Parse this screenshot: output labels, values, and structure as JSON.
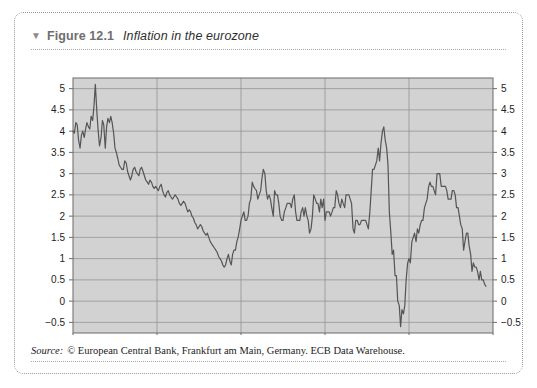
{
  "figure": {
    "triangle_glyph": "▼",
    "number": "Figure 12.1",
    "title": "Inflation in the eurozone"
  },
  "footer": {
    "source_label": "Source:",
    "source_text": "© European Central Bank, Frankfurt am Main, Germany. ECB Data Warehouse."
  },
  "colors": {
    "plot_background": "#d2d2d2",
    "gridline": "#8c8c8c",
    "line": "#555555",
    "axis": "#6b6b6b",
    "tick_label": "#1c1c1c",
    "card_border": "#9a9a9a",
    "page_background": "#ffffff"
  },
  "chart_data": {
    "type": "line",
    "title": "Inflation in the eurozone",
    "xlabel": "",
    "ylabel": "",
    "xlim": [
      1990,
      2015
    ],
    "ylim": [
      -0.75,
      5.25
    ],
    "grid": true,
    "legend_position": "none",
    "x_ticks": [
      1990,
      1995,
      2000,
      2005,
      2010,
      2015
    ],
    "x_tick_labels": [
      "1990",
      "1995",
      "2000",
      "2005",
      "2010",
      "2015"
    ],
    "y_ticks": [
      -0.5,
      0,
      0.5,
      1,
      1.5,
      2,
      2.5,
      3,
      3.5,
      4,
      4.5,
      5
    ],
    "y_tick_labels": [
      "−0.5",
      "0",
      "0.5",
      "1",
      "1.5",
      "2",
      "2.5",
      "3",
      "3.5",
      "4",
      "4.5",
      "5"
    ],
    "y_axis_both_sides": true,
    "series": [
      {
        "name": "Eurozone inflation rate (annual %, monthly)",
        "x": [
          1990.0,
          1990.08,
          1990.17,
          1990.25,
          1990.33,
          1990.42,
          1990.5,
          1990.58,
          1990.67,
          1990.75,
          1990.83,
          1990.92,
          1991.0,
          1991.08,
          1991.17,
          1991.25,
          1991.33,
          1991.42,
          1991.5,
          1991.58,
          1991.67,
          1991.75,
          1991.83,
          1991.92,
          1992.0,
          1992.08,
          1992.17,
          1992.25,
          1992.33,
          1992.42,
          1992.5,
          1992.58,
          1992.67,
          1992.75,
          1992.83,
          1992.92,
          1993.0,
          1993.08,
          1993.17,
          1993.25,
          1993.33,
          1993.42,
          1993.5,
          1993.58,
          1993.67,
          1993.75,
          1993.83,
          1993.92,
          1994.0,
          1994.08,
          1994.17,
          1994.25,
          1994.33,
          1994.42,
          1994.5,
          1994.58,
          1994.67,
          1994.75,
          1994.83,
          1994.92,
          1995.0,
          1995.08,
          1995.17,
          1995.25,
          1995.33,
          1995.42,
          1995.5,
          1995.58,
          1995.67,
          1995.75,
          1995.83,
          1995.92,
          1996.0,
          1996.08,
          1996.17,
          1996.25,
          1996.33,
          1996.42,
          1996.5,
          1996.58,
          1996.67,
          1996.75,
          1996.83,
          1996.92,
          1997.0,
          1997.08,
          1997.17,
          1997.25,
          1997.33,
          1997.42,
          1997.5,
          1997.58,
          1997.67,
          1997.75,
          1997.83,
          1997.92,
          1998.0,
          1998.08,
          1998.17,
          1998.25,
          1998.33,
          1998.42,
          1998.5,
          1998.58,
          1998.67,
          1998.75,
          1998.83,
          1998.92,
          1999.0,
          1999.08,
          1999.17,
          1999.25,
          1999.33,
          1999.42,
          1999.5,
          1999.58,
          1999.67,
          1999.75,
          1999.83,
          1999.92,
          2000.0,
          2000.08,
          2000.17,
          2000.25,
          2000.33,
          2000.42,
          2000.5,
          2000.58,
          2000.67,
          2000.75,
          2000.83,
          2000.92,
          2001.0,
          2001.08,
          2001.17,
          2001.25,
          2001.33,
          2001.42,
          2001.5,
          2001.58,
          2001.67,
          2001.75,
          2001.83,
          2001.92,
          2002.0,
          2002.08,
          2002.17,
          2002.25,
          2002.33,
          2002.42,
          2002.5,
          2002.58,
          2002.67,
          2002.75,
          2002.83,
          2002.92,
          2003.0,
          2003.08,
          2003.17,
          2003.25,
          2003.33,
          2003.42,
          2003.5,
          2003.58,
          2003.67,
          2003.75,
          2003.83,
          2003.92,
          2004.0,
          2004.08,
          2004.17,
          2004.25,
          2004.33,
          2004.42,
          2004.5,
          2004.58,
          2004.67,
          2004.75,
          2004.83,
          2004.92,
          2005.0,
          2005.08,
          2005.17,
          2005.25,
          2005.33,
          2005.42,
          2005.5,
          2005.58,
          2005.67,
          2005.75,
          2005.83,
          2005.92,
          2006.0,
          2006.08,
          2006.17,
          2006.25,
          2006.33,
          2006.42,
          2006.5,
          2006.58,
          2006.67,
          2006.75,
          2006.83,
          2006.92,
          2007.0,
          2007.08,
          2007.17,
          2007.25,
          2007.33,
          2007.42,
          2007.5,
          2007.58,
          2007.67,
          2007.75,
          2007.83,
          2007.92,
          2008.0,
          2008.08,
          2008.17,
          2008.25,
          2008.33,
          2008.42,
          2008.5,
          2008.58,
          2008.67,
          2008.75,
          2008.83,
          2008.92,
          2009.0,
          2009.08,
          2009.17,
          2009.25,
          2009.33,
          2009.42,
          2009.5,
          2009.58,
          2009.67,
          2009.75,
          2009.83,
          2009.92,
          2010.0,
          2010.08,
          2010.17,
          2010.25,
          2010.33,
          2010.42,
          2010.5,
          2010.58,
          2010.67,
          2010.75,
          2010.83,
          2010.92,
          2011.0,
          2011.08,
          2011.17,
          2011.25,
          2011.33,
          2011.42,
          2011.5,
          2011.58,
          2011.67,
          2011.75,
          2011.83,
          2011.92,
          2012.0,
          2012.08,
          2012.17,
          2012.25,
          2012.33,
          2012.42,
          2012.5,
          2012.58,
          2012.67,
          2012.75,
          2012.83,
          2012.92,
          2013.0,
          2013.08,
          2013.17,
          2013.25,
          2013.33,
          2013.42,
          2013.5,
          2013.58,
          2013.67,
          2013.75,
          2013.83,
          2013.92,
          2014.0,
          2014.08,
          2014.17,
          2014.25,
          2014.33,
          2014.42,
          2014.5,
          2014.58
        ],
        "values": [
          4.0,
          3.95,
          4.2,
          4.15,
          3.8,
          3.6,
          3.9,
          4.0,
          3.85,
          4.05,
          4.2,
          4.1,
          4.05,
          4.35,
          4.25,
          4.6,
          5.1,
          4.45,
          4.0,
          3.65,
          3.85,
          4.25,
          4.15,
          3.6,
          4.1,
          4.3,
          4.2,
          4.35,
          4.2,
          3.95,
          3.6,
          3.5,
          3.35,
          3.2,
          3.15,
          3.1,
          3.1,
          3.3,
          3.25,
          3.05,
          2.95,
          2.85,
          2.95,
          3.1,
          3.15,
          3.05,
          3.0,
          2.95,
          3.1,
          3.15,
          3.05,
          2.95,
          2.85,
          2.8,
          2.75,
          2.85,
          2.8,
          2.7,
          2.65,
          2.7,
          2.65,
          2.6,
          2.7,
          2.75,
          2.6,
          2.5,
          2.45,
          2.55,
          2.6,
          2.5,
          2.45,
          2.4,
          2.45,
          2.5,
          2.45,
          2.4,
          2.3,
          2.25,
          2.3,
          2.35,
          2.3,
          2.2,
          2.1,
          2.15,
          2.1,
          2.0,
          1.95,
          1.85,
          1.8,
          1.7,
          1.75,
          1.8,
          1.75,
          1.65,
          1.6,
          1.55,
          1.6,
          1.5,
          1.4,
          1.35,
          1.3,
          1.25,
          1.2,
          1.15,
          1.05,
          1.0,
          0.95,
          0.85,
          0.8,
          0.85,
          1.0,
          1.1,
          0.95,
          0.85,
          1.1,
          1.2,
          1.2,
          1.4,
          1.5,
          1.7,
          1.9,
          2.0,
          2.1,
          1.9,
          1.9,
          2.0,
          2.3,
          2.4,
          2.8,
          2.7,
          2.65,
          2.6,
          2.4,
          2.5,
          2.6,
          2.9,
          3.1,
          3.0,
          2.6,
          2.4,
          2.5,
          2.4,
          2.2,
          2.0,
          2.6,
          2.5,
          2.5,
          2.3,
          2.0,
          1.9,
          1.9,
          2.1,
          2.2,
          2.3,
          2.3,
          2.3,
          2.2,
          2.4,
          2.5,
          2.1,
          1.9,
          1.9,
          1.9,
          2.1,
          2.2,
          2.0,
          2.2,
          2.0,
          1.9,
          1.6,
          1.7,
          2.0,
          2.5,
          2.4,
          2.3,
          2.3,
          2.1,
          2.4,
          2.2,
          2.4,
          1.9,
          2.1,
          2.1,
          2.1,
          2.0,
          2.1,
          2.2,
          2.2,
          2.6,
          2.5,
          2.3,
          2.2,
          2.4,
          2.3,
          2.2,
          2.5,
          2.5,
          2.5,
          2.4,
          2.3,
          1.7,
          1.6,
          1.9,
          1.9,
          1.8,
          1.8,
          1.9,
          1.9,
          1.9,
          1.9,
          1.8,
          1.7,
          2.1,
          2.6,
          3.1,
          3.1,
          3.2,
          3.3,
          3.6,
          3.3,
          3.7,
          4.0,
          4.1,
          3.8,
          3.6,
          3.2,
          2.1,
          1.6,
          1.1,
          1.2,
          0.6,
          0.6,
          0.0,
          -0.1,
          -0.6,
          -0.2,
          -0.3,
          -0.1,
          0.5,
          0.9,
          1.0,
          0.9,
          1.4,
          1.5,
          1.6,
          1.4,
          1.7,
          1.6,
          1.8,
          1.9,
          1.9,
          2.2,
          2.3,
          2.4,
          2.7,
          2.8,
          2.7,
          2.7,
          2.6,
          2.5,
          3.0,
          3.0,
          3.0,
          2.7,
          2.7,
          2.7,
          2.7,
          2.6,
          2.4,
          2.4,
          2.4,
          2.6,
          2.6,
          2.5,
          2.2,
          2.2,
          2.0,
          1.8,
          1.7,
          1.2,
          1.4,
          1.6,
          1.6,
          1.3,
          1.1,
          0.7,
          0.9,
          0.8,
          0.8,
          0.7,
          0.5,
          0.7,
          0.5,
          0.5,
          0.4,
          0.35
        ]
      }
    ]
  }
}
